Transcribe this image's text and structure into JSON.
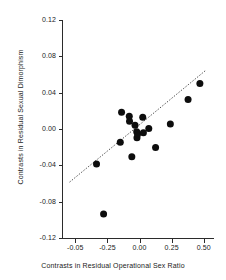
{
  "chart_data": {
    "type": "scatter",
    "title": "",
    "xlabel": "Contrasts in Residual Operational Sex Ratio",
    "ylabel": "Contrasts in Residual Sexual Dimorphism",
    "xlim": [
      -0.6,
      0.58
    ],
    "ylim": [
      -0.12,
      0.12
    ],
    "grid": false,
    "legend": null,
    "xticks": [
      -0.5,
      -0.25,
      0.0,
      0.25,
      0.5
    ],
    "xtick_labels": [
      "-0.05",
      "-0.25",
      "0.00",
      "0.25",
      "0.50"
    ],
    "yticks": [
      0.12,
      0.08,
      0.04,
      0.0,
      -0.04,
      -0.08,
      -0.12
    ],
    "ytick_labels": [
      "0.12",
      "0.08",
      "0.04",
      "0.00",
      "-0.04",
      "-0.08",
      "-0.12"
    ],
    "marker": "filled-circle",
    "marker_color": "#0d0d0d",
    "points": [
      {
        "x": -0.335,
        "y": -0.0385
      },
      {
        "x": -0.28,
        "y": -0.0935
      },
      {
        "x": -0.15,
        "y": -0.0145
      },
      {
        "x": -0.14,
        "y": 0.0185
      },
      {
        "x": -0.08,
        "y": 0.014
      },
      {
        "x": -0.078,
        "y": 0.0085
      },
      {
        "x": -0.06,
        "y": -0.0305
      },
      {
        "x": -0.035,
        "y": 0.004
      },
      {
        "x": -0.022,
        "y": -0.003
      },
      {
        "x": -0.02,
        "y": -0.0095
      },
      {
        "x": -0.015,
        "y": -0.0055
      },
      {
        "x": 0.025,
        "y": 0.013
      },
      {
        "x": 0.03,
        "y": -0.004
      },
      {
        "x": 0.072,
        "y": 0.0005
      },
      {
        "x": 0.125,
        "y": -0.0205
      },
      {
        "x": 0.24,
        "y": 0.0055
      },
      {
        "x": 0.378,
        "y": 0.0325
      },
      {
        "x": 0.47,
        "y": 0.05
      }
    ],
    "trendline": {
      "type": "linear-fit",
      "style": "dotted",
      "color": "#3a3a3a",
      "x_start": -0.545,
      "y_start": -0.0585,
      "x_end": 0.515,
      "y_end": 0.0645
    }
  },
  "axes": {
    "x_title": "Contrasts in Residual Operational Sex Ratio",
    "y_title": "Contrasts in Residual Sexual Dimorphism"
  }
}
